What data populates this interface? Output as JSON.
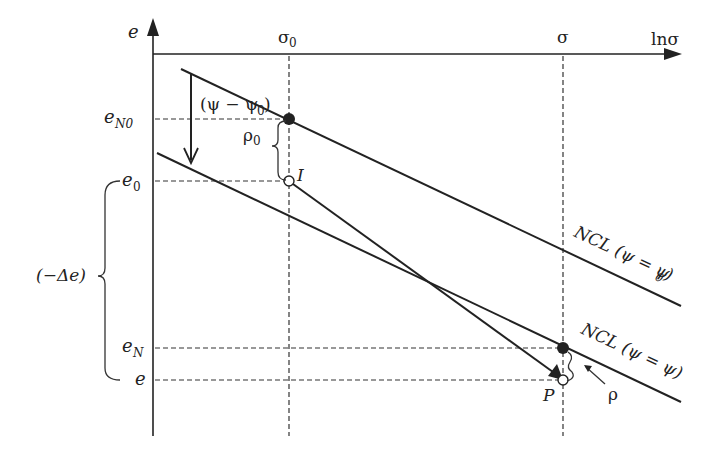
{
  "diagram": {
    "type": "e-ln(sigma) normal consolidation diagram",
    "axes": {
      "x_label": "lnσ",
      "y_label": "e",
      "x_ticks": [
        {
          "id": "sigma0",
          "label": "σ",
          "sub": "0"
        },
        {
          "id": "sigma",
          "label": "σ",
          "sub": ""
        }
      ],
      "y_ticks": [
        {
          "id": "eN0",
          "label": "e",
          "sub": "N0"
        },
        {
          "id": "e0",
          "label": "e",
          "sub": "0"
        },
        {
          "id": "eN",
          "label": "e",
          "sub": "N"
        },
        {
          "id": "e",
          "label": "e",
          "sub": ""
        }
      ]
    },
    "lines": {
      "ncl_upper": {
        "label_main": "NCL (ψ = ψ",
        "label_sub": "0",
        "label_end": ")"
      },
      "ncl_lower": {
        "label_main": "NCL (ψ = ψ)"
      }
    },
    "points": {
      "I": {
        "label": "I",
        "style": "open"
      },
      "P": {
        "label": "P",
        "style": "open"
      },
      "ncl0_point": {
        "style": "filled"
      },
      "ncl_point": {
        "style": "filled"
      }
    },
    "annotations": {
      "psi_shift": {
        "main": "(ψ − ψ",
        "sub": "0",
        "end": ")"
      },
      "rho0": {
        "main": "ρ",
        "sub": "0"
      },
      "rho": {
        "main": "ρ"
      },
      "delta_e": {
        "main": "(−Δe)"
      }
    },
    "colors": {
      "ink": "#222222",
      "background": "#ffffff"
    }
  }
}
